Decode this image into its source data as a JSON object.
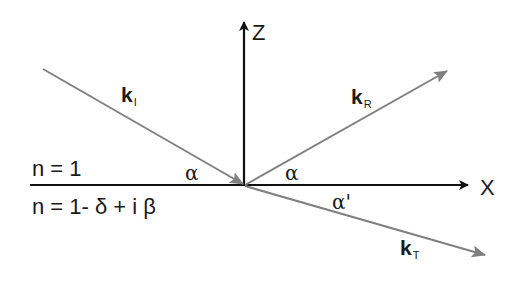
{
  "diagram": {
    "type": "reflection-refraction-geometry",
    "colors": {
      "axis": "#111111",
      "wave_vector": "#808080",
      "text": "#1a1a1a"
    },
    "axes": {
      "z_label": "Z",
      "x_label": "X"
    },
    "media": {
      "upper": "n = 1",
      "lower": "n = 1- δ + i β"
    },
    "vectors": {
      "incident": {
        "symbol": "k",
        "subscript": "I"
      },
      "reflected": {
        "symbol": "k",
        "subscript": "R"
      },
      "transmitted": {
        "symbol": "k",
        "subscript": "T"
      }
    },
    "angles": {
      "incident": "α",
      "reflected": "α",
      "transmitted": "α'"
    }
  }
}
